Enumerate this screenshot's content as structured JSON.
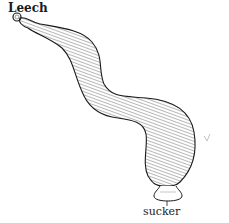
{
  "diagram": {
    "title": "Leech",
    "labels": [
      {
        "text": "sucker",
        "points_to": "posterior sucker"
      }
    ],
    "colors": {
      "ink": "#1a1a1a",
      "background": "#ffffff"
    }
  }
}
